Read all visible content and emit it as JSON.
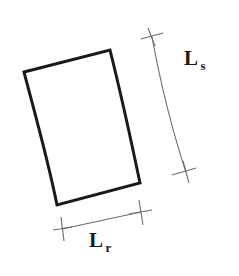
{
  "figure": {
    "background_color": "#ffffff",
    "outline_color": "#1a1a1a",
    "dimension_line_color": "#6b6b6b",
    "shape": {
      "name": "curved-quadrilateral",
      "corners": {
        "top_left": [
          24,
          72
        ],
        "top_right": [
          110,
          50
        ],
        "bottom_right": [
          140,
          183
        ],
        "bottom_left": [
          57,
          205
        ]
      },
      "edges": {
        "top": "straight",
        "right": "convex-outward",
        "bottom": "straight",
        "left": "slightly-convex-outward"
      },
      "stroke_width": 3
    },
    "dimensions": [
      {
        "id": "ls",
        "symbol": "L",
        "subscript": "s",
        "orientation": "vertical-right",
        "description": "arc length along curved side",
        "start": [
          152,
          37
        ],
        "end": [
          186,
          172
        ],
        "tick_style": "slash-cross"
      },
      {
        "id": "lr",
        "symbol": "L",
        "subscript": "r",
        "orientation": "horizontal-bottom",
        "description": "length along bottom edge",
        "start": [
          62,
          229
        ],
        "end": [
          141,
          212
        ],
        "tick_style": "vertical-cross"
      }
    ]
  }
}
